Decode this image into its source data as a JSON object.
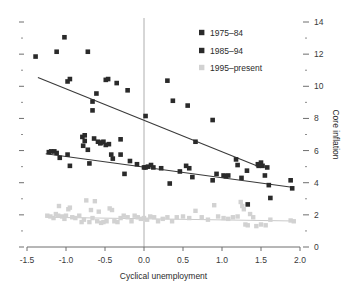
{
  "chart_data": {
    "type": "scatter",
    "title": "",
    "xlabel": "Cyclical unemployment",
    "ylabel": "Core inflation",
    "xlim": [
      -1.5,
      2.0
    ],
    "ylim": [
      0,
      14
    ],
    "xticks": [
      "-1.5",
      "-1.0",
      "-0.5",
      "0.0",
      "0.5",
      "1.0",
      "1.5",
      "2.0"
    ],
    "xtick_values": [
      -1.5,
      -1.0,
      -0.5,
      0.0,
      0.5,
      1.0,
      1.5,
      2.0
    ],
    "yticks": [
      "0",
      "2",
      "4",
      "6",
      "8",
      "10",
      "12",
      "14"
    ],
    "ytick_values": [
      0,
      2,
      4,
      6,
      8,
      10,
      12,
      14
    ],
    "y_axis_position": "right",
    "grid": false,
    "minor_ticks": true,
    "zero_line_x": 0.0,
    "legend_position": "top-center",
    "colors": {
      "series1": "#2a2a2a",
      "series2": "#2a2a2a",
      "series3": "#d2d2d2",
      "axis": "#6e6e6e",
      "zero_line": "#9a9a9a",
      "trend_dark": "#3a3a3a",
      "trend_light": "#c9c9c9"
    },
    "series": [
      {
        "name": "1975-84",
        "marker": "square",
        "color": "#2a2a2a",
        "points": [
          [
            -1.39,
            11.85
          ],
          [
            -1.02,
            13.05
          ],
          [
            -1.12,
            12.15
          ],
          [
            -0.72,
            12.15
          ],
          [
            -0.95,
            10.45
          ],
          [
            -0.98,
            10.3
          ],
          [
            -0.49,
            10.4
          ],
          [
            -0.46,
            10.45
          ],
          [
            -0.35,
            10.2
          ],
          [
            -0.21,
            9.75
          ],
          [
            -0.61,
            9.55
          ],
          [
            -0.66,
            9.05
          ],
          [
            -0.66,
            8.5
          ],
          [
            0.3,
            10.35
          ],
          [
            0.37,
            9.1
          ],
          [
            0.56,
            8.8
          ],
          [
            0.02,
            8.15
          ],
          [
            0.88,
            7.9
          ],
          [
            0.66,
            6.55
          ],
          [
            1.18,
            5.45
          ],
          [
            1.47,
            5.05
          ]
        ],
        "trend": {
          "x0": -1.36,
          "y0": 10.55,
          "x1": 1.5,
          "y1": 4.95
        }
      },
      {
        "name": "1985-94",
        "marker": "square",
        "color": "#2a2a2a",
        "points": [
          [
            -1.22,
            5.9
          ],
          [
            -1.19,
            5.95
          ],
          [
            -1.15,
            5.95
          ],
          [
            -1.12,
            5.85
          ],
          [
            -1.08,
            5.55
          ],
          [
            -0.98,
            5.75
          ],
          [
            -0.95,
            5.05
          ],
          [
            -0.79,
            6.85
          ],
          [
            -0.76,
            6.95
          ],
          [
            -0.76,
            6.6
          ],
          [
            -0.78,
            6.3
          ],
          [
            -0.72,
            6.05
          ],
          [
            -0.7,
            5.2
          ],
          [
            -0.64,
            6.75
          ],
          [
            -0.59,
            6.55
          ],
          [
            -0.56,
            6.45
          ],
          [
            -0.55,
            6.5
          ],
          [
            -0.52,
            6.55
          ],
          [
            -0.49,
            6.35
          ],
          [
            -0.45,
            6.4
          ],
          [
            -0.42,
            5.75
          ],
          [
            -0.4,
            5.5
          ],
          [
            -0.3,
            6.7
          ],
          [
            -0.3,
            5.75
          ],
          [
            -0.25,
            4.55
          ],
          [
            -0.18,
            5.35
          ],
          [
            -0.09,
            5.15
          ],
          [
            0.0,
            4.95
          ],
          [
            0.02,
            4.95
          ],
          [
            0.05,
            5.0
          ],
          [
            0.09,
            5.1
          ],
          [
            0.12,
            4.95
          ],
          [
            0.22,
            4.9
          ],
          [
            0.33,
            3.95
          ],
          [
            0.46,
            4.7
          ],
          [
            0.54,
            5.05
          ],
          [
            0.58,
            4.9
          ],
          [
            0.62,
            4.35
          ],
          [
            0.88,
            4.15
          ],
          [
            0.93,
            4.55
          ],
          [
            1.02,
            4.45
          ],
          [
            1.05,
            4.4
          ],
          [
            1.08,
            4.45
          ],
          [
            1.2,
            5.1
          ],
          [
            1.25,
            4.3
          ],
          [
            1.32,
            4.75
          ],
          [
            1.33,
            2.65
          ],
          [
            1.46,
            5.15
          ],
          [
            1.5,
            5.25
          ],
          [
            1.52,
            5.05
          ],
          [
            1.55,
            4.45
          ],
          [
            1.58,
            4.95
          ],
          [
            1.6,
            3.85
          ],
          [
            1.62,
            3.05
          ],
          [
            1.88,
            4.15
          ],
          [
            1.9,
            3.65
          ]
        ],
        "trend": {
          "x0": -1.26,
          "y0": 5.8,
          "x1": 1.92,
          "y1": 3.7
        }
      },
      {
        "name": "1995-present",
        "marker": "square",
        "color": "#d2d2d2",
        "points": [
          [
            -1.24,
            1.95
          ],
          [
            -1.2,
            1.9
          ],
          [
            -1.16,
            1.8
          ],
          [
            -1.13,
            2.05
          ],
          [
            -1.1,
            1.95
          ],
          [
            -1.09,
            2.55
          ],
          [
            -1.05,
            1.9
          ],
          [
            -1.02,
            1.75
          ],
          [
            -1.0,
            1.95
          ],
          [
            -0.97,
            2.35
          ],
          [
            -0.95,
            2.45
          ],
          [
            -0.92,
            1.85
          ],
          [
            -0.88,
            1.8
          ],
          [
            -0.83,
            1.95
          ],
          [
            -0.8,
            1.55
          ],
          [
            -0.77,
            1.7
          ],
          [
            -0.74,
            2.9
          ],
          [
            -0.7,
            1.55
          ],
          [
            -0.68,
            2.3
          ],
          [
            -0.66,
            1.8
          ],
          [
            -0.63,
            2.85
          ],
          [
            -0.6,
            1.6
          ],
          [
            -0.58,
            2.2
          ],
          [
            -0.55,
            1.5
          ],
          [
            -0.52,
            1.55
          ],
          [
            -0.48,
            1.6
          ],
          [
            -0.44,
            2.4
          ],
          [
            -0.41,
            2.3
          ],
          [
            -0.38,
            1.6
          ],
          [
            -0.34,
            1.55
          ],
          [
            -0.3,
            1.8
          ],
          [
            -0.26,
            1.95
          ],
          [
            -0.21,
            1.85
          ],
          [
            -0.16,
            1.6
          ],
          [
            -0.12,
            1.95
          ],
          [
            -0.08,
            1.85
          ],
          [
            -0.04,
            1.75
          ],
          [
            0.0,
            1.8
          ],
          [
            0.04,
            1.7
          ],
          [
            0.08,
            1.9
          ],
          [
            0.13,
            1.85
          ],
          [
            0.18,
            1.6
          ],
          [
            0.24,
            1.75
          ],
          [
            0.3,
            1.85
          ],
          [
            0.36,
            1.6
          ],
          [
            0.42,
            1.85
          ],
          [
            0.5,
            1.9
          ],
          [
            0.58,
            1.8
          ],
          [
            0.66,
            2.25
          ],
          [
            0.74,
            1.85
          ],
          [
            0.82,
            1.7
          ],
          [
            0.9,
            2.6
          ],
          [
            0.95,
            1.9
          ],
          [
            1.02,
            1.8
          ],
          [
            1.08,
            1.75
          ],
          [
            1.14,
            1.85
          ],
          [
            1.2,
            1.9
          ],
          [
            1.24,
            2.8
          ],
          [
            1.26,
            2.55
          ],
          [
            1.28,
            2.35
          ],
          [
            1.3,
            1.4
          ],
          [
            1.33,
            1.35
          ],
          [
            1.36,
            2.05
          ],
          [
            1.4,
            1.85
          ],
          [
            1.44,
            1.3
          ],
          [
            1.5,
            1.4
          ],
          [
            1.56,
            1.35
          ],
          [
            1.62,
            1.7
          ],
          [
            1.88,
            1.65
          ],
          [
            1.92,
            1.6
          ]
        ],
        "trend": {
          "x0": -1.26,
          "y0": 1.85,
          "x1": 1.94,
          "y1": 1.62
        }
      }
    ]
  },
  "legend": {
    "items": [
      {
        "label": "1975–84"
      },
      {
        "label": "1985–94"
      },
      {
        "label": "1995–present"
      }
    ]
  },
  "axes": {
    "x_title": "Cyclical unemployment",
    "y_title": "Core inflation"
  }
}
